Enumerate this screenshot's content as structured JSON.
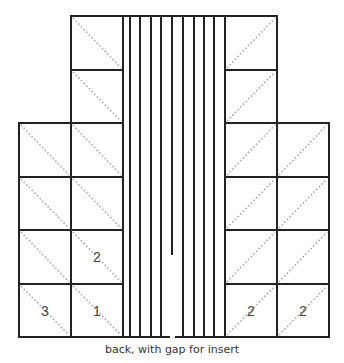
{
  "diagram": {
    "caption": "back, with gap for insert",
    "colors": {
      "line": "#222222",
      "diagonal": "#aaaaaa",
      "text": "#444444"
    },
    "left_blocks": [
      {
        "col": 1,
        "row": 0,
        "label": ""
      },
      {
        "col": 1,
        "row": 1,
        "label": ""
      },
      {
        "col": 0,
        "row": 2,
        "label": ""
      },
      {
        "col": 1,
        "row": 2,
        "label": ""
      },
      {
        "col": 0,
        "row": 3,
        "label": ""
      },
      {
        "col": 1,
        "row": 3,
        "label": ""
      },
      {
        "col": 0,
        "row": 4,
        "label": ""
      },
      {
        "col": 1,
        "row": 4,
        "label": "2"
      },
      {
        "col": 0,
        "row": 5,
        "label": "3"
      },
      {
        "col": 1,
        "row": 5,
        "label": "1"
      }
    ],
    "right_blocks": [
      {
        "col": 0,
        "row": 0,
        "label": ""
      },
      {
        "col": 0,
        "row": 1,
        "label": ""
      },
      {
        "col": 0,
        "row": 2,
        "label": ""
      },
      {
        "col": 1,
        "row": 2,
        "label": ""
      },
      {
        "col": 0,
        "row": 3,
        "label": ""
      },
      {
        "col": 1,
        "row": 3,
        "label": ""
      },
      {
        "col": 0,
        "row": 4,
        "label": ""
      },
      {
        "col": 1,
        "row": 4,
        "label": ""
      },
      {
        "col": 0,
        "row": 5,
        "label": "2"
      },
      {
        "col": 1,
        "row": 5,
        "label": "2"
      }
    ],
    "stripe_count": 11,
    "center_gap_note": "center stripe ends partway, leaving gap for insert"
  }
}
